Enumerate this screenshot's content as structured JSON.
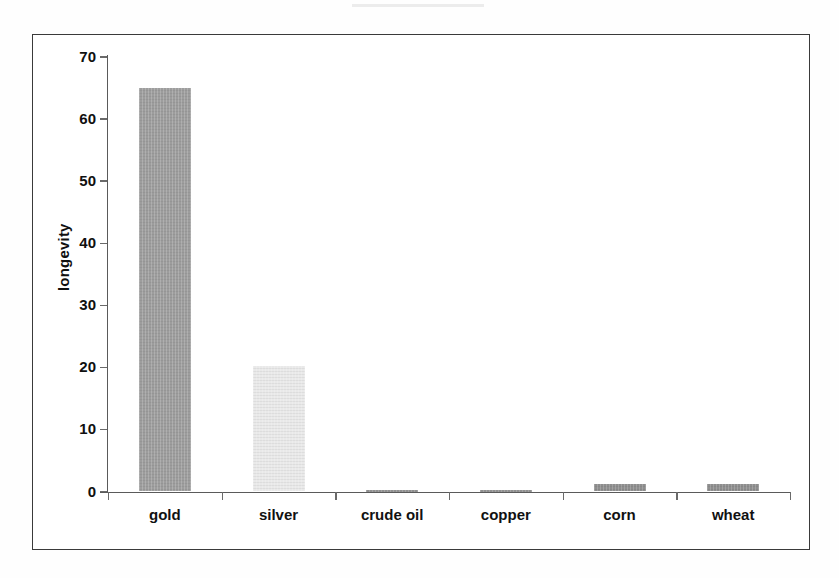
{
  "chart_data": {
    "type": "bar",
    "title": "",
    "subtitle": "",
    "xlabel": "",
    "ylabel": "longevity",
    "categories": [
      "gold",
      "silver",
      "crude oil",
      "copper",
      "corn",
      "wheat"
    ],
    "values": [
      65,
      20.2,
      0.3,
      0.2,
      1.2,
      1.2
    ],
    "series": [
      {
        "name": "longevity",
        "values": [
          65,
          20.2,
          0.3,
          0.2,
          1.2,
          1.2
        ]
      }
    ],
    "ylim": [
      0,
      70
    ],
    "yticks": [
      0,
      10,
      20,
      30,
      40,
      50,
      60,
      70
    ],
    "ytick_labels": [
      "0",
      "10",
      "20",
      "30",
      "40",
      "50",
      "60",
      "70"
    ],
    "grid": false,
    "legend": false,
    "legend_position": "none",
    "bar_colors": [
      "#9d9d9d",
      "#e9e9e9",
      "#8f8f8f",
      "#8f8f8f",
      "#8e8e8e",
      "#8e8e8e"
    ],
    "axis_color": "#5a5a5a",
    "frame_color": "#3a3a3a",
    "background_color": "#ffffff",
    "text_color": "#111111"
  },
  "chart": {
    "y_axis_title": "longevity",
    "y_ticks": [
      {
        "label": "70",
        "value": 70
      },
      {
        "label": "60",
        "value": 60
      },
      {
        "label": "50",
        "value": 50
      },
      {
        "label": "40",
        "value": 40
      },
      {
        "label": "30",
        "value": 30
      },
      {
        "label": "20",
        "value": 20
      },
      {
        "label": "10",
        "value": 10
      },
      {
        "label": "0",
        "value": 0
      }
    ],
    "bars": [
      {
        "label": "gold",
        "value": 65
      },
      {
        "label": "silver",
        "value": 20.2
      },
      {
        "label": "crude oil",
        "value": 0.3
      },
      {
        "label": "copper",
        "value": 0.2
      },
      {
        "label": "corn",
        "value": 1.2
      },
      {
        "label": "wheat",
        "value": 1.2
      }
    ]
  }
}
